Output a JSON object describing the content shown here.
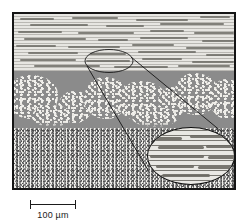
{
  "figure": {
    "type": "micrograph",
    "scale_bar": {
      "label": "100 µm",
      "length_px": 46,
      "value": 100,
      "unit": "µm"
    },
    "frame": {
      "border_color": "#151515",
      "x": 12,
      "y": 12,
      "width": 224,
      "height": 178
    },
    "layers": [
      {
        "name": "top-laminated-zone",
        "description": "light matrix with dense horizontal dark laminations / elongated streaks",
        "base_color": "#e7e6e2",
        "feature_color": "#6f6d67",
        "top": 0,
        "height": 57
      },
      {
        "name": "middle-dendritic-zone",
        "description": "dark gray matrix containing light speckled dendritic clumps",
        "base_color": "#8b8b8b",
        "feature_color": "#f2f1ed",
        "top": 57,
        "height": 57
      },
      {
        "name": "bottom-speckled-zone",
        "description": "uniform fine random salt-and-pepper speckle",
        "base_color": "#8d8d8d",
        "feature_color": "#efeeea",
        "top": 114,
        "height": 66
      }
    ],
    "callout": {
      "source_ellipse": {
        "cx": 107,
        "cy": 58.5,
        "rx": 24,
        "ry": 11.5
      },
      "inset_ellipse": {
        "cx": 177,
        "cy": 142,
        "rx": 44,
        "ry": 29
      },
      "inset_description": "magnified view of the laminated zone showing horizontal banding",
      "line_color": "#121212"
    }
  }
}
